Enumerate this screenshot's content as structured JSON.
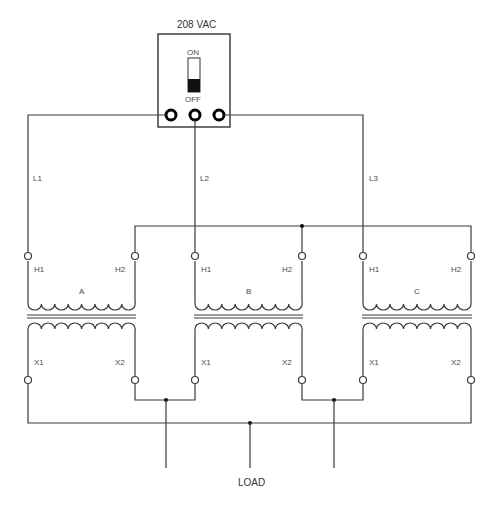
{
  "diagram": {
    "type": "three-phase transformer bank wiring schematic",
    "supply": {
      "label": "208 VAC",
      "switch_on_label": "ON",
      "switch_off_label": "OFF",
      "switch_state": "OFF"
    },
    "lines": [
      {
        "id": "L1",
        "label": "L1"
      },
      {
        "id": "L2",
        "label": "L2"
      },
      {
        "id": "L3",
        "label": "L3"
      }
    ],
    "transformers": [
      {
        "name": "A",
        "primary": [
          "H1",
          "H2"
        ],
        "secondary": [
          "X1",
          "X2"
        ]
      },
      {
        "name": "B",
        "primary": [
          "H1",
          "H2"
        ],
        "secondary": [
          "X1",
          "X2"
        ]
      },
      {
        "name": "C",
        "primary": [
          "H1",
          "H2"
        ],
        "secondary": [
          "X1",
          "X2"
        ]
      }
    ],
    "load_label": "LOAD"
  }
}
